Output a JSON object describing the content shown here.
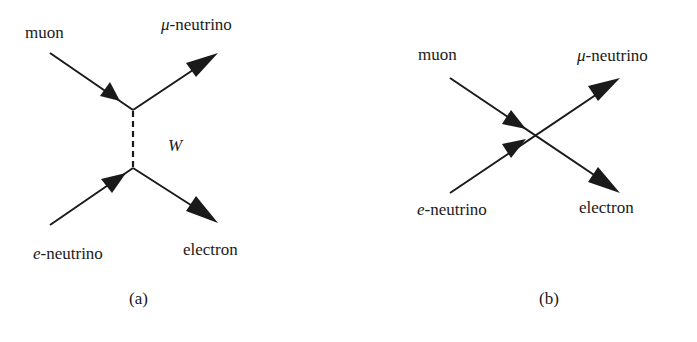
{
  "diagram_a": {
    "caption": "(a)",
    "labels": {
      "muon": "muon",
      "mu_neutrino_symbol": "μ",
      "mu_neutrino_suffix": "-neutrino",
      "e_neutrino_symbol": "e",
      "e_neutrino_suffix": "-neutrino",
      "electron": "electron",
      "boson": "W"
    }
  },
  "diagram_b": {
    "caption": "(b)",
    "labels": {
      "muon": "muon",
      "mu_neutrino_symbol": "μ",
      "mu_neutrino_suffix": "-neutrino",
      "e_neutrino_symbol": "e",
      "e_neutrino_suffix": "-neutrino",
      "electron": "electron"
    }
  },
  "colors": {
    "ink": "#1a1a1a",
    "background": "#ffffff"
  }
}
